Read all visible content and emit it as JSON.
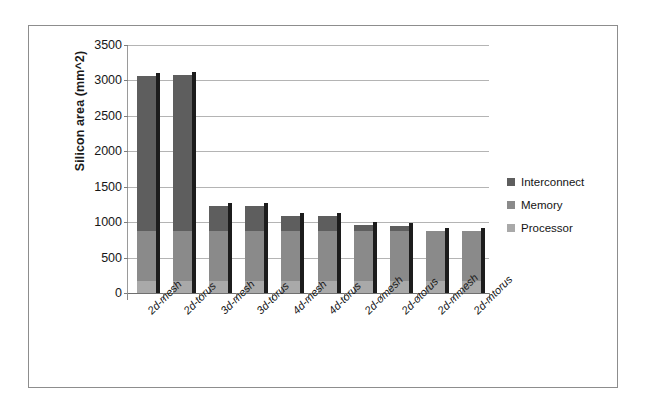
{
  "chart_data": {
    "type": "bar",
    "subtype": "stacked-column",
    "title": "",
    "xlabel": "",
    "ylabel": "Silicon area (mm^2)",
    "ylim": [
      0,
      3500
    ],
    "ytick_interval": 500,
    "yticks": [
      0,
      500,
      1000,
      1500,
      2000,
      2500,
      3000,
      3500
    ],
    "ytick_labels": [
      "0",
      "500",
      "1000",
      "1500",
      "2000",
      "2500",
      "3000",
      "3500"
    ],
    "grid": true,
    "grid_axis": "y",
    "legend_position": "right",
    "categories": [
      "2d-mesh",
      "2d-torus",
      "3d-mesh",
      "3d-torus",
      "4d-mesh",
      "4d-torus",
      "2d-omesh",
      "2d-otorus",
      "2d-mmesh",
      "2d-mtorus"
    ],
    "series": [
      {
        "name": "Processor",
        "color": "#a9a9a9",
        "values": [
          170,
          170,
          170,
          170,
          170,
          170,
          170,
          170,
          170,
          170
        ]
      },
      {
        "name": "Memory",
        "color": "#8a8a8a",
        "values": [
          700,
          700,
          700,
          700,
          700,
          700,
          700,
          700,
          700,
          700
        ]
      },
      {
        "name": "Interconnect",
        "color": "#5e5e5e",
        "values": [
          2190,
          2210,
          360,
          360,
          220,
          220,
          90,
          80,
          0,
          0
        ]
      }
    ],
    "totals": [
      3060,
      3080,
      1230,
      1230,
      1090,
      1090,
      960,
      950,
      870,
      870
    ]
  },
  "legend": {
    "items": [
      {
        "label": "Interconnect",
        "color": "#5e5e5e"
      },
      {
        "label": "Memory",
        "color": "#8a8a8a"
      },
      {
        "label": "Processor",
        "color": "#a9a9a9"
      }
    ]
  }
}
